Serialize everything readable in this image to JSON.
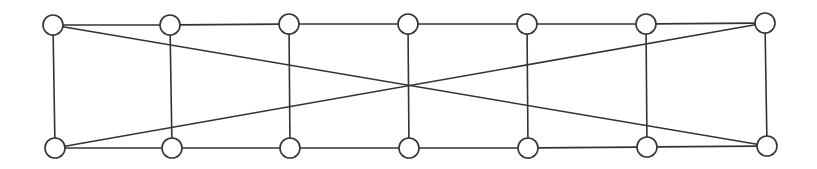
{
  "diagram": {
    "type": "graph",
    "stroke_color": "#333333",
    "node_fill": "#ffffff",
    "node_radius": 10,
    "nodes": [
      {
        "id": "t1",
        "x": 53,
        "y": 25
      },
      {
        "id": "t2",
        "x": 170,
        "y": 25
      },
      {
        "id": "t3",
        "x": 289,
        "y": 24
      },
      {
        "id": "t4",
        "x": 408,
        "y": 24
      },
      {
        "id": "t5",
        "x": 527,
        "y": 24
      },
      {
        "id": "t6",
        "x": 646,
        "y": 24
      },
      {
        "id": "t7",
        "x": 765,
        "y": 23
      },
      {
        "id": "b1",
        "x": 55,
        "y": 148
      },
      {
        "id": "b2",
        "x": 172,
        "y": 148
      },
      {
        "id": "b3",
        "x": 290,
        "y": 148
      },
      {
        "id": "b4",
        "x": 409,
        "y": 148
      },
      {
        "id": "b5",
        "x": 528,
        "y": 148
      },
      {
        "id": "b6",
        "x": 647,
        "y": 147
      },
      {
        "id": "b7",
        "x": 767,
        "y": 146
      }
    ],
    "edges": [
      [
        "t1",
        "t2"
      ],
      [
        "t2",
        "t3"
      ],
      [
        "t3",
        "t4"
      ],
      [
        "t4",
        "t5"
      ],
      [
        "t5",
        "t6"
      ],
      [
        "t6",
        "t7"
      ],
      [
        "b1",
        "b2"
      ],
      [
        "b2",
        "b3"
      ],
      [
        "b3",
        "b4"
      ],
      [
        "b4",
        "b5"
      ],
      [
        "b5",
        "b6"
      ],
      [
        "b6",
        "b7"
      ],
      [
        "t1",
        "b1"
      ],
      [
        "t2",
        "b2"
      ],
      [
        "t3",
        "b3"
      ],
      [
        "t4",
        "b4"
      ],
      [
        "t5",
        "b5"
      ],
      [
        "t6",
        "b6"
      ],
      [
        "t7",
        "b7"
      ],
      [
        "t1",
        "b7"
      ],
      [
        "b1",
        "t7"
      ]
    ]
  }
}
